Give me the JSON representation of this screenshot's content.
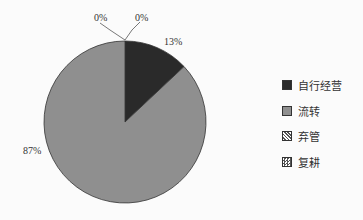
{
  "chart_data": {
    "type": "pie",
    "title": "",
    "categories": [
      "自行经营",
      "流转",
      "弃管",
      "复耕"
    ],
    "values": [
      13,
      87,
      0,
      0
    ],
    "labels": [
      "13%",
      "87%",
      "0%",
      "0%"
    ],
    "colors": [
      "#2a2a2a",
      "#8f8f8f",
      "hatch-diagonal",
      "hatch-crosshatch"
    ],
    "legend_position": "right"
  },
  "legend": {
    "items": [
      {
        "label": "自行经营",
        "swatch": "solid-dark"
      },
      {
        "label": "流转",
        "swatch": "solid-gray"
      },
      {
        "label": "弃管",
        "swatch": "diagonal-hatch"
      },
      {
        "label": "复耕",
        "swatch": "cross-hatch"
      }
    ]
  }
}
